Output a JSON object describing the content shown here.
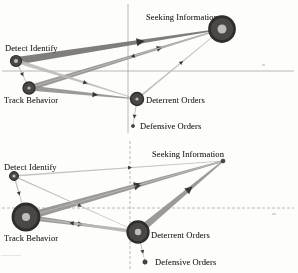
{
  "figure": {
    "type": "two-panel-network-diagram",
    "node_labels": {
      "seeking_information": "Seeking Information",
      "detect_identify": "Detect Identify",
      "track_behavior": "Track Behavior",
      "deterrent_orders": "Deterrent Orders",
      "defensive_orders": "Defensive Orders"
    },
    "colors": {
      "node_fill": "#4a4846",
      "node_ring": "#2f2d2c",
      "node_core": "#bfbdba",
      "edge_dark": "#6e6c69",
      "edge_mid": "#8e8c89",
      "edge_light": "#bcbab7",
      "axis": "#9a9895",
      "label_text": "#2e2c2b",
      "background": "#fdfdfc"
    },
    "panels": [
      {
        "id": "top",
        "axes": {
          "vertical_x": 128,
          "horizontal_y": 71,
          "style": "solid"
        },
        "nodes": [
          {
            "id": "seeking_information",
            "cx": 222,
            "cy": 29,
            "r": 12.5,
            "core_r": 4.5,
            "label_x": 146,
            "label_y": 12,
            "label_anchor": "start"
          },
          {
            "id": "detect_identify",
            "cx": 16,
            "cy": 61,
            "r": 5.5,
            "core_r": 2.0,
            "label_x": 5,
            "label_y": 43,
            "label_anchor": "start"
          },
          {
            "id": "track_behavior",
            "cx": 29,
            "cy": 88,
            "r": 6.0,
            "core_r": 1.6,
            "label_x": 4,
            "label_y": 95,
            "label_anchor": "start"
          },
          {
            "id": "deterrent_orders",
            "cx": 137,
            "cy": 99,
            "r": 6.5,
            "core_r": 1.6,
            "label_x": 146,
            "label_y": 95,
            "label_anchor": "start"
          },
          {
            "id": "defensive_orders",
            "cx": 133,
            "cy": 126,
            "r": 1.6,
            "core_r": 0.0,
            "label_x": 140,
            "label_y": 121,
            "label_anchor": "start"
          }
        ],
        "edges": [
          {
            "from": "detect_identify",
            "to": "seeking_information",
            "width": 7.5,
            "shade": "edge_dark",
            "arrow_t": 0.62
          },
          {
            "from": "track_behavior",
            "to": "seeking_information",
            "width": 5.5,
            "shade": "edge_mid",
            "arrow_t": 0.7
          },
          {
            "from": "track_behavior",
            "to": "deterrent_orders",
            "width": 5.0,
            "shade": "edge_mid",
            "arrow_t": 0.62
          },
          {
            "from": "detect_identify",
            "to": "deterrent_orders",
            "width": 4.0,
            "shade": "edge_light",
            "arrow_t": 0.58
          },
          {
            "from": "deterrent_orders",
            "to": "seeking_information",
            "width": 2.0,
            "shade": "edge_light",
            "arrow_t": 0.55
          },
          {
            "from": "seeking_information",
            "to": "track_behavior",
            "width": 1.6,
            "shade": "edge_light",
            "arrow_t": 0.45
          },
          {
            "from": "detect_identify",
            "to": "track_behavior",
            "width": 1.4,
            "shade": "edge_light",
            "arrow_t": 0.5
          },
          {
            "from": "deterrent_orders",
            "to": "defensive_orders",
            "width": 1.2,
            "shade": "edge_light",
            "arrow_t": 0.6
          }
        ]
      },
      {
        "id": "bottom",
        "axes": {
          "vertical_x": 130,
          "horizontal_y": 71,
          "style": "dashed"
        },
        "nodes": [
          {
            "id": "seeking_information",
            "cx": 223,
            "cy": 24,
            "r": 2.0,
            "core_r": 0.0,
            "label_x": 152,
            "label_y": 12,
            "label_anchor": "start"
          },
          {
            "id": "detect_identify",
            "cx": 14,
            "cy": 39,
            "r": 4.5,
            "core_r": 1.6,
            "label_x": 4,
            "label_y": 25,
            "label_anchor": "start"
          },
          {
            "id": "track_behavior",
            "cx": 26,
            "cy": 80,
            "r": 13.0,
            "core_r": 4.0,
            "label_x": 4,
            "label_y": 96,
            "label_anchor": "start"
          },
          {
            "id": "deterrent_orders",
            "cx": 138,
            "cy": 95,
            "r": 10.5,
            "core_r": 3.2,
            "label_x": 151,
            "label_y": 93,
            "label_anchor": "start"
          },
          {
            "id": "defensive_orders",
            "cx": 145,
            "cy": 125,
            "r": 2.2,
            "core_r": 0.0,
            "label_x": 155,
            "label_y": 120,
            "label_anchor": "start"
          }
        ],
        "edges": [
          {
            "from": "track_behavior",
            "to": "seeking_information",
            "width": 7.5,
            "shade": "edge_mid",
            "arrow_t": 0.55
          },
          {
            "from": "deterrent_orders",
            "to": "seeking_information",
            "width": 7.0,
            "shade": "edge_mid",
            "arrow_t": 0.58
          },
          {
            "from": "track_behavior",
            "to": "deterrent_orders",
            "width": 5.0,
            "shade": "edge_mid",
            "arrow_t": 0.48
          },
          {
            "from": "deterrent_orders",
            "to": "track_behavior",
            "width": 4.0,
            "shade": "edge_light",
            "arrow_t": 0.62
          },
          {
            "from": "detect_identify",
            "to": "seeking_information",
            "width": 1.6,
            "shade": "edge_light",
            "arrow_t": 0.55
          },
          {
            "from": "detect_identify",
            "to": "deterrent_orders",
            "width": 1.4,
            "shade": "edge_light",
            "arrow_t": 0.55
          },
          {
            "from": "detect_identify",
            "to": "track_behavior",
            "width": 1.6,
            "shade": "edge_light",
            "arrow_t": 0.5
          },
          {
            "from": "seeking_information",
            "to": "track_behavior",
            "width": 1.2,
            "shade": "edge_light",
            "arrow_t": 0.45
          },
          {
            "from": "deterrent_orders",
            "to": "defensive_orders",
            "width": 1.2,
            "shade": "edge_light",
            "arrow_t": 0.6
          }
        ]
      }
    ]
  }
}
